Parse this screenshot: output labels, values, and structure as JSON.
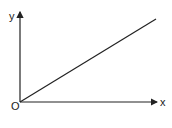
{
  "diagram": {
    "type": "coordinate-axes-with-line",
    "axes": {
      "x_label": "x",
      "y_label": "y",
      "origin_label": "O"
    },
    "line": {
      "description": "straight line through origin with positive slope",
      "from": [
        0,
        0
      ],
      "to": [
        1,
        0.6
      ]
    },
    "colors": {
      "stroke": "#222222",
      "background": "#ffffff"
    }
  }
}
